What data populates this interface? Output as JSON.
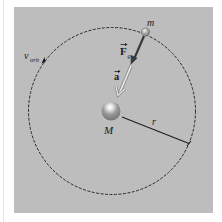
{
  "figure": {
    "labels": {
      "small_mass": "m",
      "large_mass": "M",
      "radius": "r",
      "force": "F",
      "force_subscript": "g",
      "acceleration": "a",
      "velocity": "v",
      "velocity_subscript": "orb"
    },
    "colors": {
      "panel_background": "#bdbdbd",
      "orbit_line": "#2a2a2a",
      "force_arrow": "#3a3a3a",
      "acceleration_arrow": "#e6e6e6",
      "large_mass": "#8a8a8a",
      "small_mass": "#9a9a9a"
    }
  }
}
